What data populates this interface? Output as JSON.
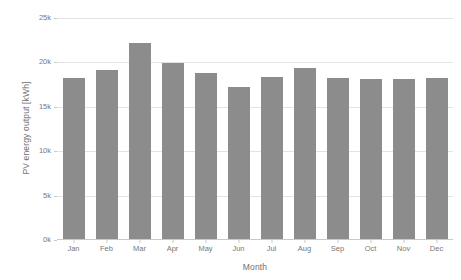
{
  "chart_data": {
    "type": "bar",
    "title": "",
    "xlabel": "Month",
    "ylabel": "PV energy output [kWh]",
    "categories": [
      "Jan",
      "Feb",
      "Mar",
      "Apr",
      "May",
      "Jun",
      "Jul",
      "Aug",
      "Sep",
      "Oct",
      "Nov",
      "Dec"
    ],
    "values": [
      18300,
      19100,
      22200,
      19900,
      18800,
      17200,
      18400,
      19400,
      18200,
      18100,
      18100,
      18300
    ],
    "series": [
      {
        "name": "PV energy output",
        "values": [
          18300,
          19100,
          22200,
          19900,
          18800,
          17200,
          18400,
          19400,
          18200,
          18100,
          18100,
          18300
        ]
      }
    ],
    "ylim": [
      0,
      25000
    ],
    "ytick_values": [
      0,
      5000,
      10000,
      15000,
      20000,
      25000
    ],
    "ytick_labels": [
      "0k",
      "5k",
      "10k",
      "15k",
      "20k",
      "25k"
    ],
    "grid": true,
    "grid_axis": "y",
    "legend": false,
    "legend_position": "none",
    "bar_color": "#8c8c8c",
    "grid_color": "#e3e3e3",
    "axis_color": "#c9c9c9",
    "text_color": "#777777",
    "background": "#ffffff"
  }
}
